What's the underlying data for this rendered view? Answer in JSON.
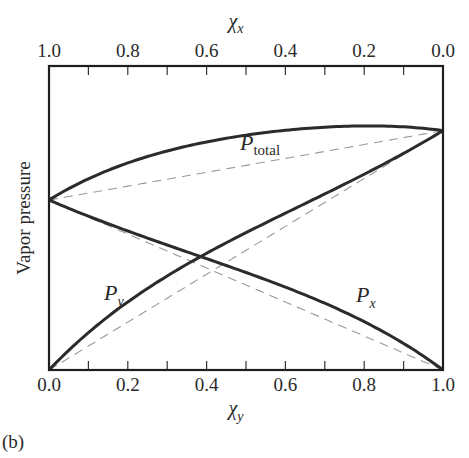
{
  "chart_data": {
    "type": "line",
    "title": "",
    "panel_label": "(b)",
    "xlabel_bottom": "χ",
    "xlabel_bottom_sub": "y",
    "xlabel_top": "χ",
    "xlabel_top_sub": "x",
    "ylabel": "Vapor pressure",
    "x_ticks_bottom": [
      "0.0",
      "0.2",
      "0.4",
      "0.6",
      "0.8",
      "1.0"
    ],
    "x_ticks_top": [
      "1.0",
      "0.8",
      "0.6",
      "0.4",
      "0.2",
      "0.0"
    ],
    "xlim": [
      0,
      1
    ],
    "ylim": [
      0,
      1.27
    ],
    "grid": false,
    "legend": "inline labels",
    "pure_pressures": {
      "P_x_star": 0.71,
      "P_y_star": 1.0
    },
    "x": [
      0.0,
      0.1,
      0.2,
      0.3,
      0.4,
      0.5,
      0.6,
      0.7,
      0.8,
      0.9,
      1.0
    ],
    "series": [
      {
        "name": "P_total",
        "style": "solid",
        "values": [
          0.71,
          0.81,
          0.88,
          0.94,
          0.99,
          1.02,
          1.05,
          1.06,
          1.06,
          1.04,
          1.0
        ]
      },
      {
        "name": "P_y",
        "style": "solid",
        "values": [
          0.0,
          0.16,
          0.3,
          0.42,
          0.53,
          0.63,
          0.72,
          0.8,
          0.87,
          0.94,
          1.0
        ]
      },
      {
        "name": "P_x",
        "style": "solid",
        "values": [
          0.71,
          0.65,
          0.58,
          0.52,
          0.46,
          0.39,
          0.33,
          0.26,
          0.19,
          0.1,
          0.0
        ]
      },
      {
        "name": "Raoult P_total (ideal)",
        "style": "dashed",
        "values": [
          0.71,
          0.74,
          0.77,
          0.8,
          0.83,
          0.855,
          0.884,
          0.913,
          0.942,
          0.971,
          1.0
        ]
      },
      {
        "name": "Raoult P_y (ideal)",
        "style": "dashed",
        "values": [
          0.0,
          0.1,
          0.2,
          0.3,
          0.4,
          0.5,
          0.6,
          0.7,
          0.8,
          0.9,
          1.0
        ]
      },
      {
        "name": "Raoult P_x (ideal)",
        "style": "dashed",
        "values": [
          0.71,
          0.639,
          0.568,
          0.497,
          0.426,
          0.355,
          0.284,
          0.213,
          0.142,
          0.071,
          0.0
        ]
      }
    ],
    "annotations": [
      {
        "text": "P",
        "sub": "total",
        "near": "P_total curve, χy≈0.5"
      },
      {
        "text": "P",
        "sub": "y",
        "near": "P_y curve, χy≈0.15"
      },
      {
        "text": "P",
        "sub": "x",
        "near": "P_x curve, χy≈0.82"
      }
    ]
  }
}
